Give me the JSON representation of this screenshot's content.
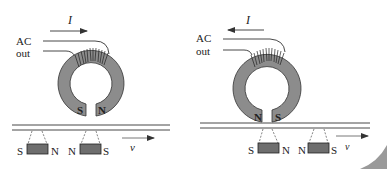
{
  "colors": {
    "core": "#8c8c8c",
    "magnet": "#6e6e6e",
    "line": "#333333",
    "text": "#222222",
    "corner": "#9a9a9a"
  },
  "panels": [
    {
      "id": "left",
      "current_label": "I",
      "current_direction": "right",
      "source_label_1": "AC",
      "source_label_2": "out",
      "gap_pole_left": "S",
      "gap_pole_right": "N",
      "magnets": [
        {
          "left_pole": "S",
          "right_pole": "N"
        },
        {
          "left_pole": "N",
          "right_pole": "S"
        }
      ],
      "velocity_label": "v",
      "velocity_direction": "right"
    },
    {
      "id": "right",
      "current_label": "I",
      "current_direction": "left",
      "source_label_1": "AC",
      "source_label_2": "out",
      "gap_pole_left": "N",
      "gap_pole_right": "S",
      "magnets": [
        {
          "left_pole": "S",
          "right_pole": "N"
        },
        {
          "left_pole": "N",
          "right_pole": "S"
        }
      ],
      "velocity_label": "v",
      "velocity_direction": "right"
    }
  ]
}
